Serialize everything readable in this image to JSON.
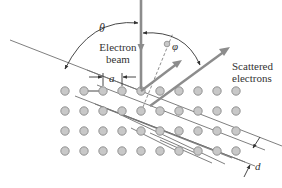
{
  "diagram": {
    "labels": {
      "theta": "θ",
      "phi": "φ",
      "electron_beam_line1": "Electron",
      "electron_beam_line2": "beam",
      "scattered_line1": "Scattered",
      "scattered_line2": "electrons",
      "lattice_spacing": "a",
      "plane_spacing": "d"
    },
    "colors": {
      "atom_fill": "#c8c8c8",
      "atom_stroke": "#8a8a8a",
      "beam": "#8c8c8c",
      "line": "#707070",
      "text": "#333333",
      "arrow": "#555555"
    },
    "lattice": {
      "columns": 10,
      "rows": 4,
      "x_start": 65,
      "x_spacing": 19,
      "y_start": 91,
      "y_spacing": 20
    }
  }
}
